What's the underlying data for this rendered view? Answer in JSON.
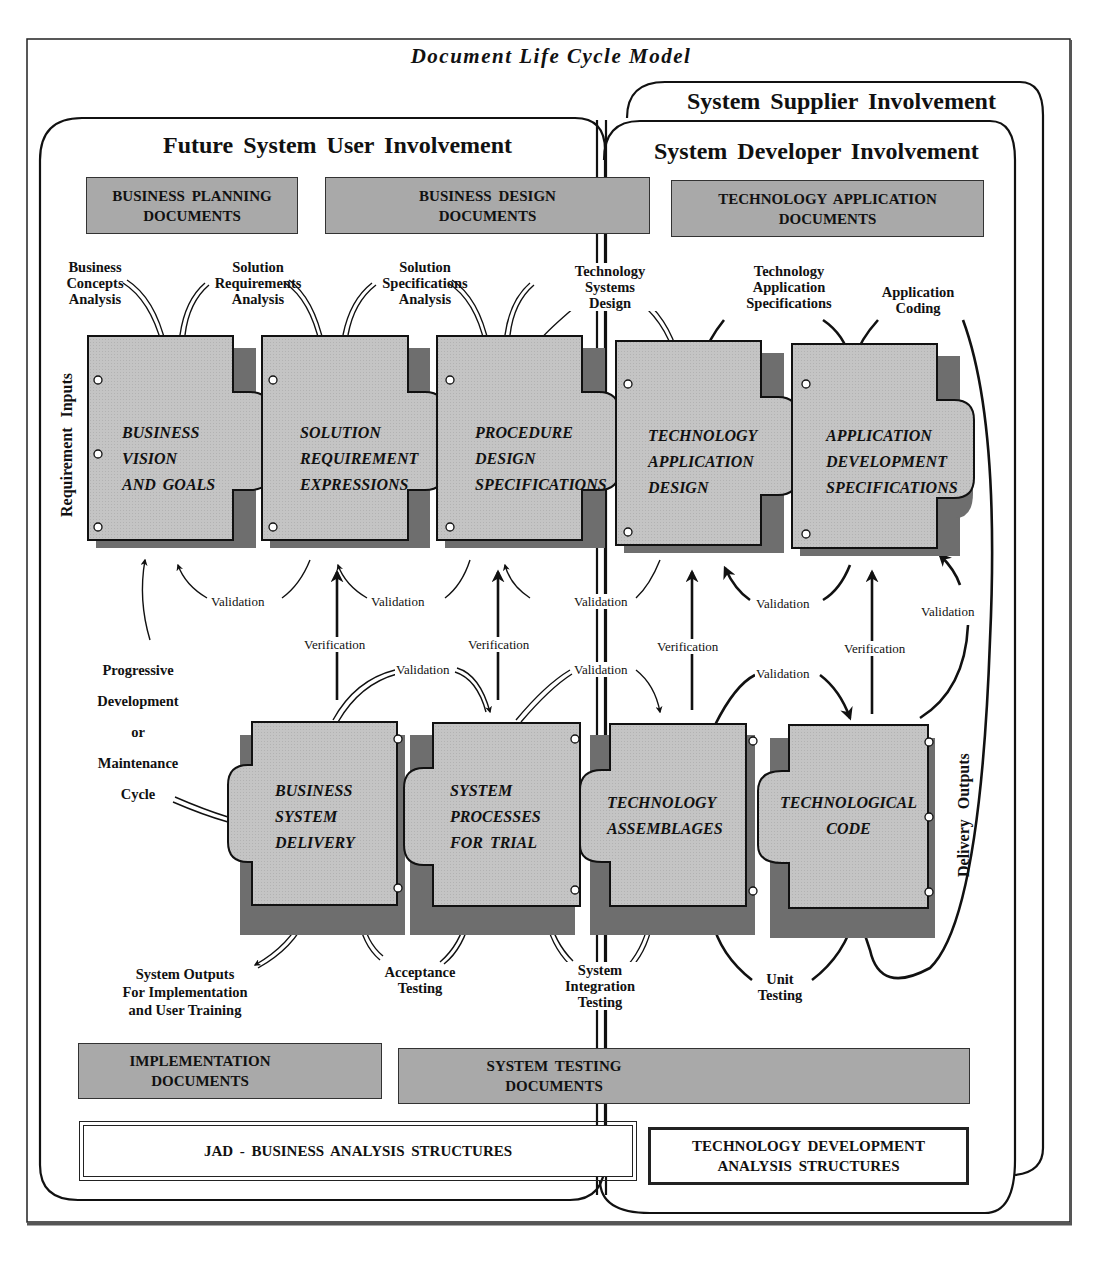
{
  "title": "Document Life Cycle Model",
  "regions": {
    "user": "Future System User Involvement",
    "supplier": "System Supplier Involvement",
    "developer": "System Developer Involvement"
  },
  "doc_boxes": {
    "business_planning": [
      "BUSINESS PLANNING",
      "DOCUMENTS"
    ],
    "business_design": [
      "BUSINESS DESIGN",
      "DOCUMENTS"
    ],
    "technology_application": [
      "TECHNOLOGY APPLICATION",
      "DOCUMENTS"
    ],
    "implementation": [
      "IMPLEMENTATION",
      "DOCUMENTS"
    ],
    "system_testing": [
      "SYSTEM TESTING",
      "DOCUMENTS"
    ]
  },
  "structures": {
    "jad": "JAD - BUSINESS ANALYSIS STRUCTURES",
    "tech_dev": [
      "TECHNOLOGY DEVELOPMENT",
      "ANALYSIS STRUCTURES"
    ]
  },
  "side_labels": {
    "requirement_inputs": "Requirement Inputs",
    "delivery_outputs": "Delivery Outputs",
    "cycle": [
      "Progressive",
      "Development",
      "or",
      "Maintenance",
      "Cycle"
    ]
  },
  "top_pieces": [
    {
      "lines": [
        "BUSINESS",
        "VISION",
        "AND GOALS"
      ]
    },
    {
      "lines": [
        "SOLUTION",
        "REQUIREMENT",
        "EXPRESSIONS"
      ]
    },
    {
      "lines": [
        "PROCEDURE",
        "DESIGN",
        "SPECIFICATIONS"
      ]
    },
    {
      "lines": [
        "TECHNOLOGY",
        "APPLICATION",
        "DESIGN"
      ]
    },
    {
      "lines": [
        "APPLICATION",
        "DEVELOPMENT",
        "SPECIFICATIONS"
      ]
    }
  ],
  "bottom_pieces": [
    {
      "lines": [
        "BUSINESS",
        "SYSTEM",
        "DELIVERY"
      ]
    },
    {
      "lines": [
        "SYSTEM",
        "PROCESSES",
        "FOR TRIAL"
      ]
    },
    {
      "lines": [
        "TECHNOLOGY",
        "ASSEMBLAGES"
      ]
    },
    {
      "lines": [
        "TECHNOLOGICAL",
        "CODE"
      ]
    }
  ],
  "top_activities": [
    [
      "Business",
      "Concepts",
      "Analysis"
    ],
    [
      "Solution",
      "Requirements",
      "Analysis"
    ],
    [
      "Solution",
      "Specifications",
      "Analysis"
    ],
    [
      "Technology",
      "Systems",
      "Design"
    ],
    [
      "Technology",
      "Application",
      "Specifications"
    ],
    [
      "Application",
      "Coding"
    ]
  ],
  "bottom_activities": [
    [
      "System Outputs",
      "For Implementation",
      "and User Training"
    ],
    [
      "Acceptance",
      "Testing"
    ],
    [
      "System",
      "Integration",
      "Testing"
    ],
    [
      "Unit",
      "Testing"
    ]
  ],
  "arrow_labels": {
    "validation": "Validation",
    "verification": "Verification"
  }
}
